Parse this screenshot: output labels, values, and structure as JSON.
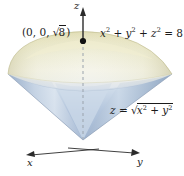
{
  "figure": {
    "background_color": "#ffffff",
    "width": 184,
    "height": 176
  },
  "axes": {
    "z_label": "z",
    "x_label": "x",
    "y_label": "y",
    "origin": {
      "x": 83,
      "y": 138
    },
    "z_tip": {
      "x": 83,
      "y": 8
    },
    "x_tip": {
      "x": 28,
      "y": 154
    },
    "y_tip": {
      "x": 138,
      "y": 152
    },
    "color": "#2b2b2b",
    "dashed_axis_color": "#9aa3ad"
  },
  "point": {
    "label_prefix": "(0, 0, ",
    "label_radical": "8",
    "label_suffix": ")",
    "marker_color": "#111111",
    "position": {
      "x": 83,
      "y": 41
    }
  },
  "equations": {
    "sphere": {
      "lhs_x": "x",
      "lhs_y": "y",
      "lhs_z": "z",
      "exponent": "2",
      "plus": " + ",
      "equals": " = ",
      "rhs": "8",
      "full_text": "x² + y² + z² = 8"
    },
    "cone": {
      "lhs": "z",
      "equals": " = ",
      "radical_x": "x",
      "radical_y": "y",
      "exponent": "2",
      "plus": " + ",
      "full_text": "z = √(x² + y²)"
    }
  },
  "surfaces": {
    "sphere_cap": {
      "name": "spherical-cap",
      "color_top": "#e9e6c8",
      "color_mid": "#ece9d2",
      "color_bottom": "#f3f2e6",
      "edge_color": "#c9c49a"
    },
    "cone": {
      "name": "cone-surface",
      "color_light": "#dfe7f0",
      "color_mid": "#bccbdf",
      "color_dark": "#8fa6c2",
      "edge_color": "#8fa0b6"
    },
    "seam_color": "#cfd8e4"
  },
  "colors": {
    "accent_blue": "#8fa6c2",
    "accent_cream": "#e9e6c8",
    "ink": "#1a1a1a"
  }
}
